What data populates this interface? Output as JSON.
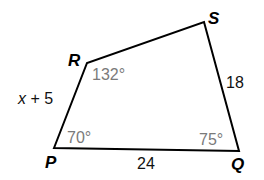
{
  "diagram": {
    "type": "quadrilateral",
    "vertices": [
      {
        "name": "P",
        "x": 54,
        "y": 148
      },
      {
        "name": "R",
        "x": 87,
        "y": 63
      },
      {
        "name": "S",
        "x": 204,
        "y": 22
      },
      {
        "name": "Q",
        "x": 239,
        "y": 151
      }
    ],
    "vertex_labels": {
      "P": "P",
      "Q": "Q",
      "R": "R",
      "S": "S"
    },
    "side_labels": {
      "PR_var": "x",
      "PR_rest": " + 5",
      "SQ": "18",
      "PQ": "24"
    },
    "angle_labels": {
      "R": "132°",
      "P": "70°",
      "Q": "75°"
    },
    "colors": {
      "edge": "#000000",
      "angle_text": "#7a7a7a",
      "side_text": "#111111",
      "background": "#ffffff"
    }
  }
}
